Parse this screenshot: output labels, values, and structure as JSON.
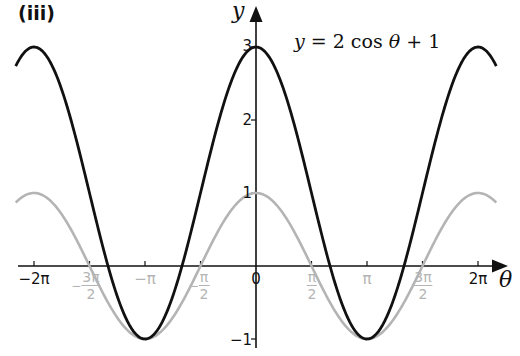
{
  "figure": {
    "part_label": "(iii)",
    "equation": {
      "lhs": "y",
      "equals": " = ",
      "rhs_coef": "2 cos ",
      "rhs_var": "θ",
      "rhs_tail": " + 1"
    },
    "x_axis_name": "θ",
    "y_axis_name": "y",
    "x_ticks_black": [
      {
        "label": "−2π",
        "value": -6.2832
      },
      {
        "label": "−π",
        "value": -3.1416,
        "gray": true
      },
      {
        "label": "0",
        "value": 0
      },
      {
        "label": "π",
        "value": 3.1416,
        "gray": true
      },
      {
        "label": "2π",
        "value": 6.2832
      }
    ],
    "x_ticks_fraction": [
      {
        "sign": "−",
        "num": "3π",
        "den": "2",
        "value": -4.7124
      },
      {
        "sign": "−",
        "num": "π",
        "den": "2",
        "value": -1.5708
      },
      {
        "sign": "",
        "num": "π",
        "den": "2",
        "value": 1.5708
      },
      {
        "sign": "",
        "num": "3π",
        "den": "2",
        "value": 4.7124
      }
    ],
    "y_ticks": [
      {
        "label": "3",
        "value": 3
      },
      {
        "label": "2",
        "value": 2
      },
      {
        "label": "1",
        "value": 1
      },
      {
        "label": "−1",
        "value": -1
      }
    ],
    "colors": {
      "primary_curve": "#111111",
      "reference_curve": "#b4b4b4",
      "axes": "#111111"
    }
  },
  "chart_data": {
    "type": "line",
    "title": "(iii)",
    "annotation": "y = 2cosθ + 1",
    "xlabel": "θ",
    "ylabel": "y",
    "xlim": [
      -6.9,
      7.1
    ],
    "ylim": [
      -1.1,
      3.3
    ],
    "grid": false,
    "legend": null,
    "x_tick_labels": [
      "−2π",
      "−3π/2",
      "−π",
      "−π/2",
      "0",
      "π/2",
      "π",
      "3π/2",
      "2π"
    ],
    "y_tick_labels": [
      "−1",
      "1",
      "2",
      "3"
    ],
    "series": [
      {
        "name": "y = 2cosθ + 1",
        "style": "solid black, thick",
        "x": [
          -6.8,
          -6.2832,
          -4.7124,
          -3.1416,
          -1.5708,
          0,
          1.5708,
          3.1416,
          4.7124,
          6.2832,
          6.8
        ],
        "values": [
          2.71,
          3,
          1,
          -1,
          1,
          3,
          1,
          -1,
          1,
          3,
          2.71
        ]
      },
      {
        "name": "y = cosθ",
        "style": "solid light gray",
        "x": [
          -6.8,
          -6.2832,
          -4.7124,
          -3.1416,
          -1.5708,
          0,
          1.5708,
          3.1416,
          4.7124,
          6.2832,
          6.8
        ],
        "values": [
          0.87,
          1,
          0,
          -1,
          0,
          1,
          0,
          -1,
          0,
          1,
          0.87
        ]
      }
    ]
  }
}
